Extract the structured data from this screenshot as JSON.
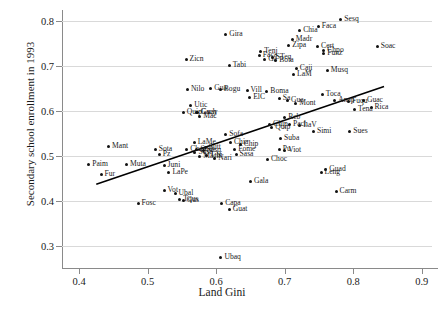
{
  "chart_data": {
    "type": "scatter",
    "title": "",
    "xlabel": "Land Gini",
    "ylabel": "Secondary school enrollment in 1993",
    "xlim": [
      0.375,
      0.915
    ],
    "ylim": [
      0.265,
      0.825
    ],
    "xticks": [
      "0.4",
      "0.5",
      "0.6",
      "0.7",
      "0.8",
      "0.9"
    ],
    "xtickvals": [
      0.4,
      0.5,
      0.6,
      0.7,
      0.8,
      0.9
    ],
    "yticks": [
      "0.3",
      "0.4",
      "0.5",
      "0.6",
      "0.7",
      "0.8"
    ],
    "ytickvals": [
      0.3,
      0.4,
      0.5,
      0.6,
      0.7,
      0.8
    ],
    "grid": "horizontal",
    "legend": "none",
    "marker_color": "#111111",
    "trendline": {
      "type": "linear-fit",
      "color": "#000000",
      "x": [
        0.425,
        0.845
      ],
      "y": [
        0.438,
        0.655
      ]
    },
    "points": [
      {
        "label": "Paim",
        "x": 0.414,
        "y": 0.481
      },
      {
        "label": "Mant",
        "x": 0.443,
        "y": 0.521
      },
      {
        "label": "Fur",
        "x": 0.432,
        "y": 0.459
      },
      {
        "label": "Muta",
        "x": 0.469,
        "y": 0.481
      },
      {
        "label": "Fosc",
        "x": 0.486,
        "y": 0.396
      },
      {
        "label": "Sota",
        "x": 0.511,
        "y": 0.516
      },
      {
        "label": "Pz",
        "x": 0.517,
        "y": 0.503
      },
      {
        "label": "Juni",
        "x": 0.524,
        "y": 0.479
      },
      {
        "label": "LaPe",
        "x": 0.531,
        "y": 0.463
      },
      {
        "label": "Vot",
        "x": 0.524,
        "y": 0.423
      },
      {
        "label": "Ubal",
        "x": 0.54,
        "y": 0.418
      },
      {
        "label": "Tqus",
        "x": 0.547,
        "y": 0.403
      },
      {
        "label": "Gus",
        "x": 0.552,
        "y": 0.401
      },
      {
        "label": "Zicn",
        "x": 0.556,
        "y": 0.716
      },
      {
        "label": "Nilo",
        "x": 0.558,
        "y": 0.649
      },
      {
        "label": "Utic",
        "x": 0.563,
        "y": 0.613
      },
      {
        "label": "Guay",
        "x": 0.573,
        "y": 0.598
      },
      {
        "label": "Quip",
        "x": 0.552,
        "y": 0.598
      },
      {
        "label": "Gach",
        "x": 0.572,
        "y": 0.597
      },
      {
        "label": "Mac",
        "x": 0.576,
        "y": 0.588
      },
      {
        "label": "Chap",
        "x": 0.557,
        "y": 0.516
      },
      {
        "label": "LaMe",
        "x": 0.568,
        "y": 0.53
      },
      {
        "label": "Sues",
        "x": 0.572,
        "y": 0.516
      },
      {
        "label": "Susa",
        "x": 0.569,
        "y": 0.508
      },
      {
        "label": "Mach",
        "x": 0.576,
        "y": 0.5
      },
      {
        "label": "Tibi",
        "x": 0.586,
        "y": 0.501
      },
      {
        "label": "Sesq",
        "x": 0.581,
        "y": 0.513
      },
      {
        "label": "Sutt",
        "x": 0.584,
        "y": 0.52
      },
      {
        "label": "Nari",
        "x": 0.598,
        "y": 0.494
      },
      {
        "label": "Ubaq",
        "x": 0.607,
        "y": 0.275
      },
      {
        "label": "Capa",
        "x": 0.608,
        "y": 0.396
      },
      {
        "label": "Guat",
        "x": 0.619,
        "y": 0.381
      },
      {
        "label": "Bogu",
        "x": 0.606,
        "y": 0.648
      },
      {
        "label": "Gua",
        "x": 0.592,
        "y": 0.65
      },
      {
        "label": "Gira",
        "x": 0.614,
        "y": 0.77
      },
      {
        "label": "Tabi",
        "x": 0.619,
        "y": 0.702
      },
      {
        "label": "Sofa",
        "x": 0.614,
        "y": 0.548
      },
      {
        "label": "Chia",
        "x": 0.621,
        "y": 0.53
      },
      {
        "label": "Fome",
        "x": 0.627,
        "y": 0.514
      },
      {
        "label": "Sasa",
        "x": 0.629,
        "y": 0.505
      },
      {
        "label": "Chip",
        "x": 0.635,
        "y": 0.527
      },
      {
        "label": "Vill",
        "x": 0.645,
        "y": 0.646
      },
      {
        "label": "ElC",
        "x": 0.649,
        "y": 0.631
      },
      {
        "label": "Gala",
        "x": 0.65,
        "y": 0.443
      },
      {
        "label": "Tenj",
        "x": 0.665,
        "y": 0.732
      },
      {
        "label": "Faca",
        "x": 0.663,
        "y": 0.723
      },
      {
        "label": "Ga",
        "x": 0.671,
        "y": 0.715
      },
      {
        "label": "STeq",
        "x": 0.682,
        "y": 0.719
      },
      {
        "label": "Bota",
        "x": 0.687,
        "y": 0.713
      },
      {
        "label": "Boma",
        "x": 0.674,
        "y": 0.644
      },
      {
        "label": "Choc",
        "x": 0.675,
        "y": 0.493
      },
      {
        "label": "Chip2",
        "x": 0.678,
        "y": 0.571
      },
      {
        "label": "Quip2",
        "x": 0.681,
        "y": 0.563
      },
      {
        "label": "Suba",
        "x": 0.694,
        "y": 0.54
      },
      {
        "label": "Pu",
        "x": 0.692,
        "y": 0.515
      },
      {
        "label": "Viot",
        "x": 0.7,
        "y": 0.512
      },
      {
        "label": "Sa",
        "x": 0.692,
        "y": 0.628
      },
      {
        "label": "Gua2",
        "x": 0.704,
        "y": 0.624
      },
      {
        "label": "Reb",
        "x": 0.7,
        "y": 0.586
      },
      {
        "label": "Pach",
        "x": 0.707,
        "y": 0.57
      },
      {
        "label": "Zipa",
        "x": 0.706,
        "y": 0.746
      },
      {
        "label": "Madr",
        "x": 0.711,
        "y": 0.76
      },
      {
        "label": "Chia2",
        "x": 0.722,
        "y": 0.78
      },
      {
        "label": "Caji",
        "x": 0.717,
        "y": 0.694
      },
      {
        "label": "LaM",
        "x": 0.713,
        "y": 0.682
      },
      {
        "label": "Mont",
        "x": 0.716,
        "y": 0.618
      },
      {
        "label": "LaV",
        "x": 0.722,
        "y": 0.568
      },
      {
        "label": "Faca2",
        "x": 0.749,
        "y": 0.788
      },
      {
        "label": "Cert",
        "x": 0.748,
        "y": 0.745
      },
      {
        "label": "Chpo",
        "x": 0.757,
        "y": 0.736
      },
      {
        "label": "Funz",
        "x": 0.757,
        "y": 0.729
      },
      {
        "label": "Sesq2",
        "x": 0.782,
        "y": 0.805
      },
      {
        "label": "Musq",
        "x": 0.762,
        "y": 0.69
      },
      {
        "label": "Toca",
        "x": 0.755,
        "y": 0.638
      },
      {
        "label": "Simi",
        "x": 0.742,
        "y": 0.554
      },
      {
        "label": "Anap",
        "x": 0.773,
        "y": 0.624
      },
      {
        "label": "Fuqu",
        "x": 0.793,
        "y": 0.622
      },
      {
        "label": "Guac",
        "x": 0.815,
        "y": 0.623
      },
      {
        "label": "Rica",
        "x": 0.826,
        "y": 0.608
      },
      {
        "label": "Tena",
        "x": 0.802,
        "y": 0.603
      },
      {
        "label": "Sues2",
        "x": 0.795,
        "y": 0.554
      },
      {
        "label": "Soac",
        "x": 0.835,
        "y": 0.745
      },
      {
        "label": "Guad",
        "x": 0.76,
        "y": 0.47
      },
      {
        "label": "Leng",
        "x": 0.753,
        "y": 0.463
      },
      {
        "label": "Carm",
        "x": 0.775,
        "y": 0.422
      }
    ]
  }
}
